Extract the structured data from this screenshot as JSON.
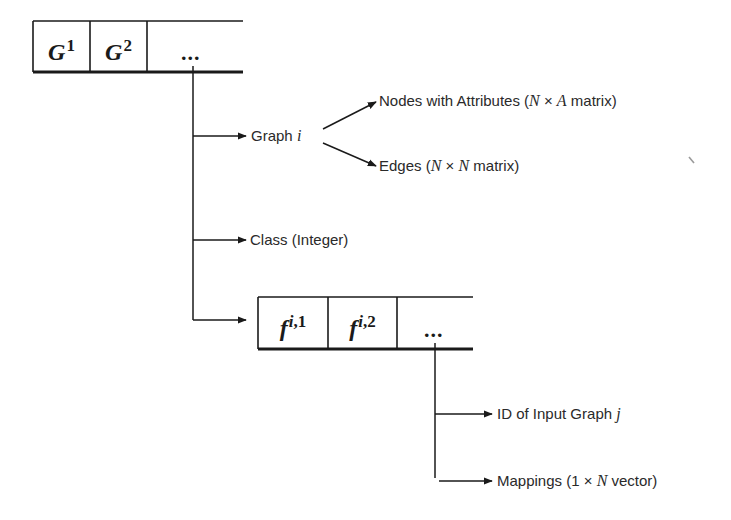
{
  "diagram": {
    "type": "data-structure tree",
    "top_array": {
      "cells": [
        {
          "base": "G",
          "sup": "1"
        },
        {
          "base": "G",
          "sup": "2"
        }
      ],
      "ellipsis": "..."
    },
    "graph_branch": {
      "label": "Graph",
      "var": "i",
      "children": [
        {
          "prefix": "Nodes with Attributes (",
          "m1": "N",
          "op": " × ",
          "m2": "A",
          "suffix": " matrix)"
        },
        {
          "prefix": "Edges (",
          "m1": "N",
          "op": " × ",
          "m2": "N",
          "suffix": " matrix)"
        }
      ]
    },
    "class_branch": {
      "label": "Class (Integer)"
    },
    "mapping_array": {
      "cells": [
        {
          "base": "f",
          "sup_var": "i",
          "sup_rest": ",1"
        },
        {
          "base": "f",
          "sup_var": "i",
          "sup_rest": ",2"
        }
      ],
      "ellipsis": "..."
    },
    "mapping_children": [
      {
        "prefix": "ID of Input Graph ",
        "var": "j"
      },
      {
        "prefix": "Mappings (1 × ",
        "var": "N",
        "suffix": " vector)"
      }
    ],
    "colors": {
      "line": "#1a1a1a",
      "text": "#2a2a2a",
      "background": "#ffffff"
    }
  }
}
